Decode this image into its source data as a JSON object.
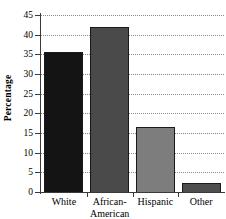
{
  "chart_data": {
    "type": "bar",
    "title": "",
    "subtitle": "",
    "xlabel": "",
    "ylabel": "Percentage",
    "categories": [
      "White",
      "African-American",
      "Hispanic",
      "Other"
    ],
    "category_lines": [
      [
        "White"
      ],
      [
        "African-",
        "American"
      ],
      [
        "Hispanic"
      ],
      [
        "Other"
      ]
    ],
    "values": [
      35.5,
      42.0,
      16.5,
      2.3
    ],
    "ylim": [
      0,
      45
    ],
    "ytick_labels": [
      "0",
      "5",
      "10",
      "15",
      "20",
      "25",
      "30",
      "35",
      "40",
      "45"
    ],
    "ytick_values": [
      0,
      5,
      10,
      15,
      20,
      25,
      30,
      35,
      40,
      45
    ],
    "grid": "horizontal-dotted",
    "legend": "none",
    "bar_colors": [
      "#141414",
      "#4a4a4a",
      "#7d7d7d",
      "#4e4e4e"
    ],
    "bar_border_color": "#1a1a1a",
    "axis_color": "#3a3a3a",
    "gridline_color": "#8a8a8a",
    "background_color": "#ffffff"
  }
}
